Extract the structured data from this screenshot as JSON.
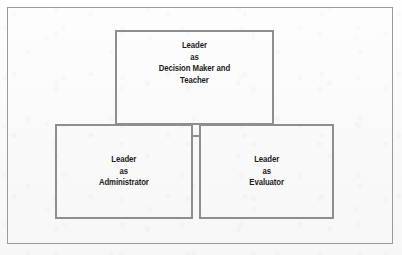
{
  "figure": {
    "background_color": "#fcfcfc",
    "line_color": "#8e8e8e",
    "frame_color": "#9a9a9a",
    "text_color": "#1c1c1c"
  },
  "diagram": {
    "type": "triad-box-diagram",
    "nodes": [
      {
        "id": "leader-decision-maker-teacher",
        "label": "Leader\nas\nDecision Maker and\nTeacher",
        "position": "top"
      },
      {
        "id": "leader-administrator",
        "label": "Leader\nas\nAdministrator",
        "position": "bottom-left"
      },
      {
        "id": "leader-evaluator",
        "label": "Leader\nas\nEvaluator",
        "position": "bottom-right"
      }
    ],
    "connectors": [
      {
        "id": "administrator-evaluator-link",
        "from": "leader-administrator",
        "to": "leader-evaluator",
        "orientation": "horizontal"
      }
    ]
  }
}
